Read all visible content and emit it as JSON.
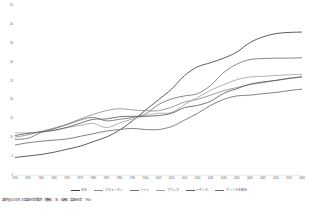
{
  "caption": "諸外国と日本の高齢化率推移（横軸：年／縦軸：高齢化率（％））",
  "chart_data": {
    "type": "line",
    "title": "諸外国と日本の高齢化率推移",
    "xlabel": "年",
    "ylabel": "高齢化率（％）",
    "xlim": [
      1950,
      2060
    ],
    "ylim": [
      0,
      45
    ],
    "ytick_step": 5,
    "grid": false,
    "legend_position": "bottom",
    "x": [
      1950,
      1955,
      1960,
      1965,
      1970,
      1975,
      1980,
      1985,
      1990,
      1995,
      2000,
      2005,
      2010,
      2015,
      2020,
      2025,
      2030,
      2035,
      2040,
      2045,
      2050,
      2055,
      2060
    ],
    "ytick_labels": [
      "0",
      "5",
      "10",
      "15",
      "20",
      "25",
      "30",
      "35",
      "40",
      "45"
    ],
    "xtick_labels": [
      "1950",
      "1955",
      "1960",
      "1965",
      "1970",
      "1975",
      "1980",
      "1985",
      "1990",
      "1995",
      "2000",
      "2005",
      "2010",
      "2015",
      "2020",
      "2025",
      "2030",
      "2035",
      "2040",
      "2045",
      "2050",
      "2055",
      "2060"
    ],
    "series": [
      {
        "name": "日本",
        "color": "#3f3f3f",
        "values": [
          4.9,
          5.3,
          5.7,
          6.3,
          7.1,
          7.9,
          9.1,
          10.3,
          12.1,
          14.6,
          17.4,
          20.2,
          23.0,
          26.6,
          28.9,
          30.0,
          31.2,
          32.8,
          35.3,
          36.8,
          37.7,
          38.0,
          38.1
        ]
      },
      {
        "name": "スウェーデン",
        "color": "#8d8d8d",
        "values": [
          10.3,
          10.9,
          11.8,
          12.7,
          13.7,
          15.1,
          16.3,
          17.3,
          17.8,
          17.5,
          17.3,
          17.3,
          18.2,
          19.6,
          20.3,
          21.4,
          22.6,
          23.4,
          24.2,
          24.7,
          25.3,
          25.9,
          26.3
        ]
      },
      {
        "name": "ドイツ",
        "color": "#737373",
        "values": [
          9.7,
          10.0,
          11.5,
          12.5,
          13.6,
          14.8,
          15.5,
          14.6,
          15.0,
          15.5,
          16.4,
          18.9,
          20.4,
          21.2,
          21.8,
          24.0,
          27.4,
          29.6,
          30.8,
          31.1,
          31.2,
          31.2,
          31.3
        ]
      },
      {
        "name": "フランス",
        "color": "#a5a5a5",
        "values": [
          11.4,
          11.4,
          11.6,
          12.1,
          12.8,
          13.4,
          13.9,
          12.8,
          14.0,
          15.1,
          16.0,
          16.6,
          16.8,
          18.9,
          20.8,
          22.7,
          24.2,
          25.5,
          26.2,
          26.4,
          26.6,
          26.8,
          26.9
        ]
      },
      {
        "name": "イギリス",
        "color": "#5b5b5b",
        "values": [
          10.7,
          11.3,
          11.7,
          12.1,
          12.9,
          14.0,
          15.0,
          15.1,
          15.7,
          15.8,
          15.8,
          16.0,
          16.6,
          18.1,
          18.7,
          19.8,
          21.9,
          23.1,
          24.3,
          24.9,
          25.3,
          25.8,
          26.2
        ]
      },
      {
        "name": "アメリカ合衆国",
        "color": "#6b6b6b",
        "values": [
          8.2,
          8.8,
          9.2,
          9.5,
          9.8,
          10.5,
          11.2,
          11.9,
          12.3,
          12.6,
          12.3,
          12.3,
          13.1,
          14.8,
          16.6,
          18.7,
          20.3,
          21.2,
          21.4,
          21.8,
          22.1,
          22.6,
          23.0
        ]
      }
    ]
  },
  "legend": {
    "items": [
      {
        "label": "日本",
        "color": "#3f3f3f"
      },
      {
        "label": "スウェーデン",
        "color": "#8d8d8d"
      },
      {
        "label": "ドイツ",
        "color": "#737373"
      },
      {
        "label": "フランス",
        "color": "#a5a5a5"
      },
      {
        "label": "イギリス",
        "color": "#5b5b5b"
      },
      {
        "label": "アメリカ合衆国",
        "color": "#6b6b6b"
      }
    ]
  }
}
